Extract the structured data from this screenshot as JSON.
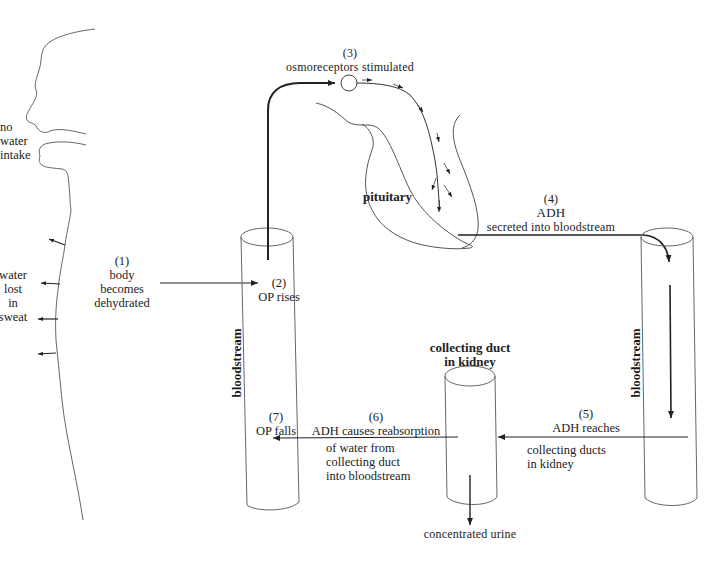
{
  "diagram": {
    "type": "flow diagram",
    "labels": {
      "no_water_intake": [
        "no",
        "water",
        "intake"
      ],
      "water_lost_in_sweat": [
        "water",
        "lost",
        "in",
        "sweat"
      ],
      "step1": {
        "num": "(1)",
        "lines": [
          "body",
          "becomes",
          "dehydrated"
        ]
      },
      "step2": {
        "num": "(2)",
        "text": "OP rises"
      },
      "step3": {
        "num": "(3)",
        "text": "osmoreceptors stimulated"
      },
      "pituitary": "pituitary",
      "step4": {
        "num": "(4)",
        "title": "ADH",
        "text": "secreted into bloodstream"
      },
      "step5": {
        "num": "(5)",
        "title": "ADH reaches",
        "lines": [
          "collecting ducts",
          "in kidney"
        ]
      },
      "step6": {
        "num": "(6)",
        "title": "ADH causes reabsorption",
        "lines": [
          "of water from",
          "collecting duct",
          "into bloodstream"
        ]
      },
      "step7": {
        "num": "(7)",
        "text": "OP falls"
      },
      "collecting_duct": [
        "collecting duct",
        "in kidney"
      ],
      "bloodstream_left": "bloodstream",
      "bloodstream_right": "bloodstream",
      "concentrated_urine": "concentrated urine"
    },
    "colors": {
      "line": "#222222",
      "thin_line": "#555555",
      "background": "#ffffff"
    }
  }
}
